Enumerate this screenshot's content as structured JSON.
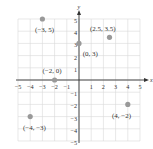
{
  "chart_data": {
    "type": "scatter",
    "title": "",
    "xlabel": "x",
    "ylabel": "y",
    "xlim": [
      -5,
      5
    ],
    "ylim": [
      -5,
      5
    ],
    "grid": true,
    "x_ticks": [
      -5,
      -4,
      -3,
      -2,
      -1,
      1,
      2,
      3,
      4,
      5
    ],
    "x_tick_labels": [
      "−5",
      "−4",
      "−3",
      "−2",
      "−1",
      "1",
      "2",
      "3",
      "4",
      "5"
    ],
    "y_ticks": [
      5,
      4,
      3,
      2,
      1,
      -1,
      -2,
      -3,
      -4,
      -5
    ],
    "y_tick_labels": [
      "5",
      "4",
      "3",
      "2",
      "1",
      "−1",
      "−2",
      "−3",
      "−4",
      "−5"
    ],
    "points": [
      {
        "x": -3,
        "y": 5,
        "label": "(−3, 5)",
        "lx": -3.6,
        "ly": 3.9
      },
      {
        "x": 2.5,
        "y": 3.5,
        "label": "(2.5, 3.5)",
        "lx": 0.9,
        "ly": 4.0
      },
      {
        "x": 0,
        "y": 3,
        "label": "(0, 3)",
        "lx": 0.3,
        "ly": 2.0
      },
      {
        "x": -2,
        "y": 0,
        "label": "(−2, 0)",
        "lx": -3.0,
        "ly": 0.6
      },
      {
        "x": -4,
        "y": -3,
        "label": "(−4, −3)",
        "lx": -4.6,
        "ly": -4.1
      },
      {
        "x": 4,
        "y": -2,
        "label": "(4, −2)",
        "lx": 2.7,
        "ly": -3.1
      }
    ],
    "point_color": "#999999",
    "axis_color": "#333333",
    "grid_color": "#d9d9d9"
  }
}
